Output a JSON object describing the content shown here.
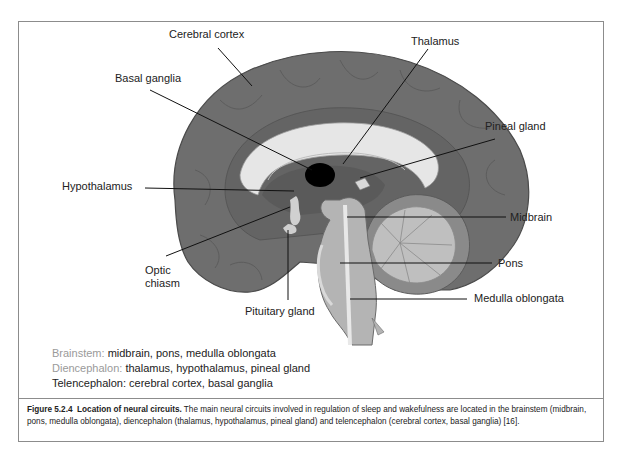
{
  "figure": {
    "labels": {
      "cerebral_cortex": "Cerebral cortex",
      "thalamus": "Thalamus",
      "basal_ganglia": "Basal ganglia",
      "pineal_gland": "Pineal gland",
      "hypothalamus": "Hypothalamus",
      "midbrain": "Midbrain",
      "optic_chiasm_line1": "Optic",
      "optic_chiasm_line2": "chiasm",
      "pons": "Pons",
      "pituitary_gland": "Pituitary gland",
      "medulla_oblongata": "Medulla oblongata"
    },
    "legend": [
      {
        "key": "Brainstem:",
        "value": "midbrain, pons, medulla oblongata",
        "key_color": "#9a9a9a"
      },
      {
        "key": "Diencephalon:",
        "value": "thalamus, hypothalamus, pineal gland",
        "key_color": "#9a9a9a"
      },
      {
        "key": "Telencephalon:",
        "value": "cerebral cortex, basal ganglia",
        "key_color": "#222222"
      }
    ],
    "caption": {
      "number": "Figure 5.2.4",
      "title": "Location of neural circuits.",
      "text": "The main neural circuits involved in regulation of sleep and wakefulness are located in the brainstem (midbrain, pons, medulla oblongata), diencephalon (thalamus, hypothalamus, pineal gland) and telencephalon (cerebral cortex, basal ganglia) [16]."
    },
    "colors": {
      "cortex": "#6e6e6e",
      "corpus_callosum": "#e6e6e6",
      "diencephalon": "#5a5a5a",
      "brainstem": "#b4b4b4",
      "cerebellum": "#b9b9b9",
      "basal_ganglia": "#000000",
      "frame": "#8c8c8c"
    }
  }
}
